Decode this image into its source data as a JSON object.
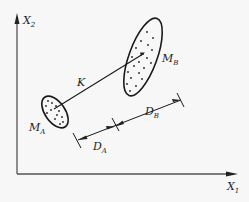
{
  "diagram": {
    "axes": {
      "x_label": "X",
      "x_sub": "1",
      "y_label": "X",
      "y_sub": "2"
    },
    "clusters": [
      {
        "id": "A",
        "label": "M",
        "sub": "A"
      },
      {
        "id": "B",
        "label": "M",
        "sub": "B"
      }
    ],
    "connector": {
      "label": "K"
    },
    "dimensions": [
      {
        "label": "D",
        "sub": "A"
      },
      {
        "label": "D",
        "sub": "B"
      }
    ],
    "colors": {
      "background": "#f7f7f7",
      "stroke": "#1a1a1a",
      "axis": "#555555"
    }
  }
}
